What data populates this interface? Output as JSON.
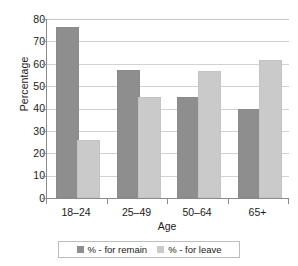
{
  "chart_data": {
    "type": "bar",
    "title": "",
    "xlabel": "Age",
    "ylabel": "Percentage",
    "categories": [
      "18–24",
      "25–49",
      "50–64",
      "65+"
    ],
    "series": [
      {
        "name": "% - for remain",
        "color": "#8e8e8e",
        "values": [
          75,
          56,
          44,
          38.5
        ]
      },
      {
        "name": "% - for leave",
        "color": "#cacaca",
        "values": [
          25,
          44,
          55.5,
          60.5
        ]
      }
    ],
    "ylim": [
      0,
      80
    ],
    "ytick_step": 10,
    "ytick_labels": [
      "80",
      "70",
      "60",
      "50",
      "40",
      "30",
      "20",
      "10",
      "0"
    ],
    "grid": "horizontal",
    "legend_position": "bottom",
    "legend_entries": [
      "% - for remain",
      "% - for leave"
    ]
  },
  "axes": {
    "y_title": "Percentage",
    "x_title": "Age"
  }
}
